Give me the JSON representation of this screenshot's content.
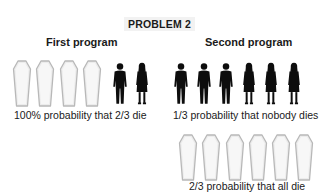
{
  "title": "PROBLEM 2",
  "programs": [
    {
      "heading": "First program",
      "outcomes": [
        {
          "figures": [
            "coffin",
            "coffin",
            "coffin",
            "coffin",
            "man",
            "woman"
          ],
          "caption": "100% probability that 2/3 die"
        }
      ]
    },
    {
      "heading": "Second program",
      "outcomes": [
        {
          "figures": [
            "man",
            "man",
            "man",
            "woman",
            "woman",
            "woman"
          ],
          "caption": "1/3 probability that nobody dies"
        },
        {
          "figures": [
            "coffin",
            "coffin",
            "coffin",
            "coffin",
            "coffin",
            "coffin"
          ],
          "caption": "2/3 probability that all die"
        }
      ]
    }
  ],
  "colors": {
    "silhouette": "#0d0d0d",
    "coffin_fill": "#ececec",
    "coffin_edge": "#b8b8b8",
    "text": "#1a1a1a"
  }
}
